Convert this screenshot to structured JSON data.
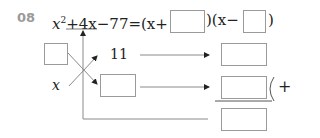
{
  "problem": {
    "number": "08",
    "equation": {
      "lhs_term1_base": "x",
      "lhs_term1_exp": "2",
      "lhs_term2": "+4x",
      "lhs_term3": "−77",
      "equals": "=",
      "factor1_open": "(x+",
      "factor1_close": ")",
      "factor2_open": "(x−",
      "factor2_close": ")"
    },
    "diagram": {
      "left_var": "x",
      "top_value": "11",
      "sum_sign": "+"
    },
    "blanks": [
      {
        "id": "factor1-blank",
        "value": ""
      },
      {
        "id": "factor2-blank",
        "value": ""
      },
      {
        "id": "left-top-blank",
        "value": ""
      },
      {
        "id": "middle-blank",
        "value": ""
      },
      {
        "id": "right-top-blank",
        "value": ""
      },
      {
        "id": "right-middle-blank",
        "value": ""
      },
      {
        "id": "right-bottom-blank",
        "value": ""
      }
    ],
    "colors": {
      "label": "#9a9a9a",
      "text": "#222222",
      "lines": "#8a8a8a"
    }
  }
}
